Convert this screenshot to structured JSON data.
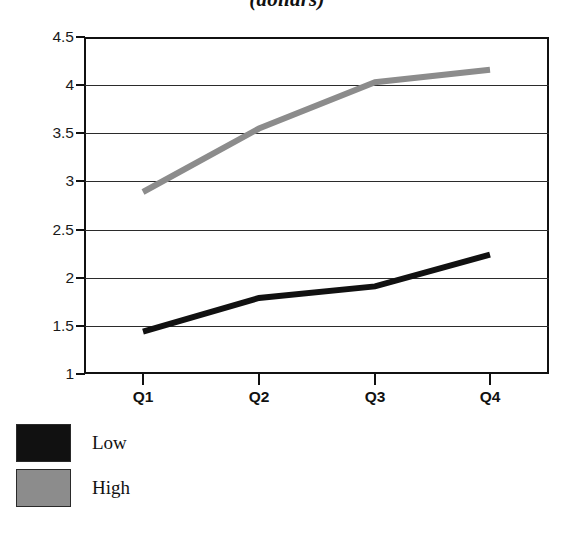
{
  "chart_data": {
    "type": "line",
    "title": "(dollars)",
    "title_note": "partially cropped heading at top of image",
    "xlabel": "",
    "ylabel": "",
    "categories": [
      "Q1",
      "Q2",
      "Q3",
      "Q4"
    ],
    "series": [
      {
        "name": "Low",
        "color": "#111111",
        "values": [
          1.44,
          1.79,
          1.91,
          2.24
        ]
      },
      {
        "name": "High",
        "color": "#8c8c8c",
        "values": [
          2.89,
          3.55,
          4.03,
          4.16
        ]
      }
    ],
    "ylim": [
      1,
      4.5
    ],
    "ytick_labels": [
      "4.5",
      "4",
      "3.5",
      "3",
      "2.5",
      "2",
      "1.5",
      "1"
    ],
    "ytick_values": [
      4.5,
      4,
      3.5,
      3,
      2.5,
      2,
      1.5,
      1
    ],
    "grid": true,
    "grid_axis": "y",
    "legend_position": "below-left",
    "legend": [
      {
        "label": "Low",
        "color": "#111111"
      },
      {
        "label": "High",
        "color": "#8c8c8c"
      }
    ]
  },
  "colors": {
    "low": "#111111",
    "high": "#8c8c8c",
    "axis": "#111111",
    "grid": "#2b2b2b",
    "background": "#ffffff"
  }
}
